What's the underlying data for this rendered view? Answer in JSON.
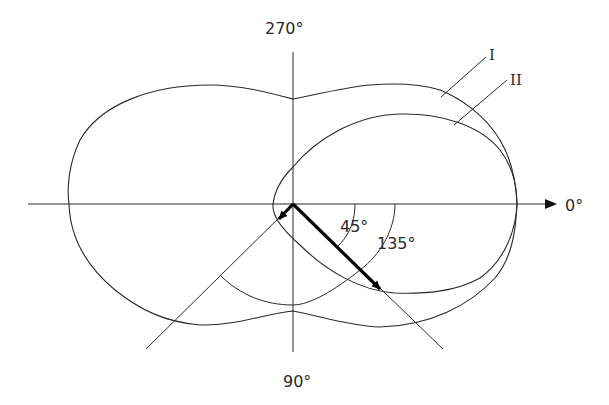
{
  "diagram": {
    "type": "polar-radiation-pattern",
    "axis_labels": {
      "top": "270°",
      "right": "0°",
      "bottom": "90°"
    },
    "angle_labels": {
      "inner": "45°",
      "outer": "135°"
    },
    "curve_labels": {
      "curve_1": "I",
      "curve_2": "II"
    },
    "colors": {
      "line": "#2a2a2a",
      "arrow": "#000000",
      "background": "#ffffff"
    }
  }
}
